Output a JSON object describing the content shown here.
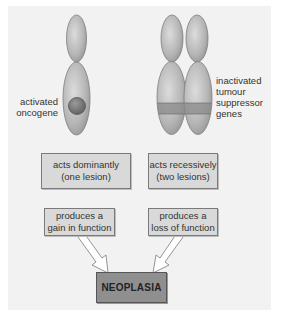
{
  "diagram": {
    "left": {
      "label_line1": "activated",
      "label_line2": "oncogene",
      "box1_line1": "acts dominantly",
      "box1_line2": "(one lesion)",
      "box2_line1": "produces a",
      "box2_line2": "gain in function"
    },
    "right": {
      "label_line1": "inactivated",
      "label_line2": "tumour",
      "label_line3": "suppressor",
      "label_line4": "genes",
      "box1_line1": "acts recessively",
      "box1_line2": "(two lesions)",
      "box2_line1": "produces a",
      "box2_line2": "loss of function"
    },
    "outcome": "NEOPLASIA",
    "colors": {
      "panel": "#f2f2f2",
      "chromosome": "#b8b8b8",
      "box": "#d9d9d9",
      "outcome_box": "#8f8f8f",
      "band": "#8a8a8a"
    }
  }
}
